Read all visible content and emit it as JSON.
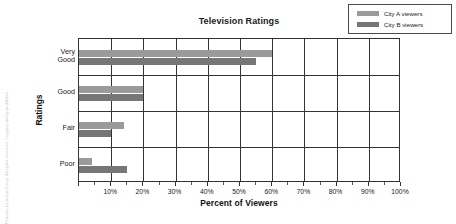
{
  "copyright": "Pearson Learning Group. All rights reserved. Copying strictly prohibited.",
  "chart_data": {
    "type": "bar",
    "orientation": "horizontal",
    "title": "Television Ratings",
    "xlabel": "Percent of Viewers",
    "ylabel": "Ratings",
    "categories": [
      "Very Good",
      "Good",
      "Fair",
      "Poor"
    ],
    "series": [
      {
        "name": "City A viewers",
        "color": "#9a9a9a",
        "values": [
          60,
          20,
          14,
          4
        ]
      },
      {
        "name": "City B viewers",
        "color": "#767676",
        "values": [
          55,
          20,
          10,
          15
        ]
      }
    ],
    "xlim": [
      0,
      100
    ],
    "xticks": [
      0,
      10,
      20,
      30,
      40,
      50,
      60,
      70,
      80,
      90,
      100
    ],
    "xtick_labels": [
      "",
      "10%",
      "20%",
      "30%",
      "40%",
      "50%",
      "60%",
      "70%",
      "80%",
      "90%",
      "100%"
    ],
    "grid": "vertical",
    "legend_position": "top-right"
  }
}
